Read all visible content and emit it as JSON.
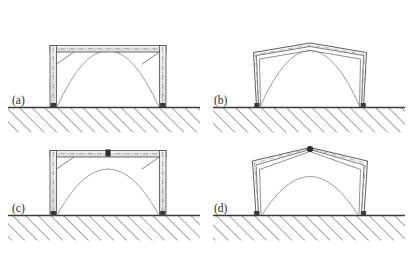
{
  "figure": {
    "background_color": "#ffffff",
    "line_color": "#4a4a4a",
    "dark_marker_color": "#2b2b2b",
    "hatch_color": "#555555",
    "member_fill": "#e8e8e8",
    "width": 412,
    "height": 253
  },
  "panels": [
    {
      "id": "a",
      "label": "(a)",
      "label_x": 12,
      "label_y": 104,
      "kind": "undeformed-portal-frame",
      "description": "Upright portal frame with box-section columns and rafter beam, knee haunches at both corners, dashed member centerlines, pinned base plates on hatched ground, single parabolic overlay curve rising above the roof",
      "ground_y": 107,
      "ground_x0": 8,
      "ground_x1": 200,
      "frame": {
        "base_left_x": 53,
        "base_right_x": 163,
        "eaves_y": 47,
        "apex_y": 47,
        "roof_shape": "flat"
      },
      "apex_hinge_marker": false,
      "overlay_curves": 1
    },
    {
      "id": "b",
      "label": "(b)",
      "label_x": 214,
      "label_y": 104,
      "kind": "sway-collapse-mechanism",
      "description": "Collapsed portal frame, columns splayed outward and rafters sagged into a shallow gable; three nested deformed outlines showing progressive collapse stages, pinned bases fixed on hatched ground, parabolic overlay curve",
      "ground_y": 107,
      "ground_x0": 213,
      "ground_x1": 405,
      "frame": {
        "base_left_x": 256,
        "base_right_x": 363,
        "eaves_y": 52,
        "apex_y": 43,
        "roof_shape": "shallow-gable"
      },
      "apex_hinge_marker": false,
      "overlay_curves": 1,
      "deformed_outlines": 3
    },
    {
      "id": "c",
      "label": "(c)",
      "label_x": 12,
      "label_y": 212,
      "kind": "undeformed-portal-frame-with-apex-hinge",
      "description": "Upright portal frame identical to (a) but with a dark plastic hinge block at the ridge centre of the rafter; parabolic overlay curve peaks just below the roof line",
      "ground_y": 215,
      "ground_x0": 8,
      "ground_x1": 200,
      "frame": {
        "base_left_x": 53,
        "base_right_x": 163,
        "eaves_y": 152,
        "apex_y": 152,
        "roof_shape": "flat"
      },
      "apex_hinge_marker": true,
      "overlay_curves": 1
    },
    {
      "id": "d",
      "label": "(d)",
      "label_x": 214,
      "label_y": 212,
      "kind": "gable-collapse-mechanism",
      "description": "Collapsed portal frame with sharply peaked gable and a dark hinge node at the apex; three nested deformed outlines, columns leaning outward from pinned bases, parabolic overlay curve",
      "ground_y": 215,
      "ground_x0": 213,
      "ground_x1": 405,
      "frame": {
        "base_left_x": 256,
        "base_right_x": 363,
        "eaves_y": 162,
        "apex_y": 148,
        "roof_shape": "steep-gable"
      },
      "apex_hinge_marker": true,
      "overlay_curves": 1,
      "deformed_outlines": 3
    }
  ],
  "ground": {
    "hatch_angle_deg": 45,
    "hatch_spacing_px": 9,
    "hatch_depth_px": 26,
    "line_width_px": 1.3
  }
}
